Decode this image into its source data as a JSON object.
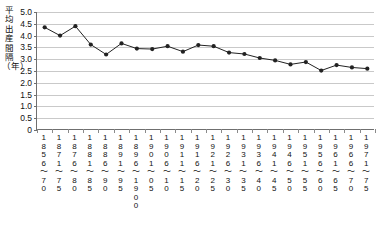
{
  "chart_data": {
    "type": "line",
    "title": "",
    "xlabel": "出生の出生年（歳）",
    "ylabel": "平均出産間隔（年）",
    "ylim": [
      0,
      5.0
    ],
    "yticks": [
      "0",
      "0.5",
      "1.0",
      "1.5",
      "2.0",
      "2.5",
      "3.0",
      "3.5",
      "4.0",
      "4.5",
      "5.0"
    ],
    "grid": true,
    "legend": "none",
    "marker": "filled-circle",
    "line_color": "#222222",
    "categories": [
      "1856～70",
      "1871～75",
      "1876～80",
      "1881～85",
      "1886～90",
      "1891～95",
      "1896～1900",
      "1901～05",
      "1906～10",
      "1911～15",
      "1916～20",
      "1921～25",
      "1926～30",
      "1931～35",
      "1936～40",
      "1941～45",
      "1946～50",
      "1951～55",
      "1956～60",
      "1961～65",
      "1966～70",
      "1971～75"
    ],
    "categories_stacked": [
      [
        "1",
        "8",
        "5",
        "6",
        "～",
        "7",
        "0"
      ],
      [
        "1",
        "8",
        "7",
        "1",
        "～",
        "7",
        "5"
      ],
      [
        "1",
        "8",
        "7",
        "6",
        "～",
        "8",
        "0"
      ],
      [
        "1",
        "8",
        "8",
        "1",
        "～",
        "8",
        "5"
      ],
      [
        "1",
        "8",
        "8",
        "6",
        "～",
        "9",
        "0"
      ],
      [
        "1",
        "8",
        "9",
        "1",
        "～",
        "9",
        "5"
      ],
      [
        "1",
        "8",
        "9",
        "6",
        "～",
        "1",
        "9",
        "0",
        "0"
      ],
      [
        "1",
        "9",
        "0",
        "1",
        "～",
        "0",
        "5"
      ],
      [
        "1",
        "9",
        "0",
        "6",
        "～",
        "1",
        "0"
      ],
      [
        "1",
        "9",
        "1",
        "1",
        "～",
        "1",
        "5"
      ],
      [
        "1",
        "9",
        "1",
        "6",
        "～",
        "2",
        "0"
      ],
      [
        "1",
        "9",
        "2",
        "1",
        "～",
        "2",
        "5"
      ],
      [
        "1",
        "9",
        "2",
        "6",
        "～",
        "3",
        "0"
      ],
      [
        "1",
        "9",
        "3",
        "1",
        "～",
        "3",
        "5"
      ],
      [
        "1",
        "9",
        "3",
        "6",
        "～",
        "4",
        "0"
      ],
      [
        "1",
        "9",
        "4",
        "1",
        "～",
        "4",
        "5"
      ],
      [
        "1",
        "9",
        "4",
        "6",
        "～",
        "5",
        "0"
      ],
      [
        "1",
        "9",
        "5",
        "1",
        "～",
        "5",
        "5"
      ],
      [
        "1",
        "9",
        "5",
        "6",
        "～",
        "6",
        "0"
      ],
      [
        "1",
        "9",
        "6",
        "1",
        "～",
        "6",
        "5"
      ],
      [
        "1",
        "9",
        "6",
        "6",
        "～",
        "7",
        "0"
      ],
      [
        "1",
        "9",
        "7",
        "1",
        "～",
        "7",
        "5"
      ]
    ],
    "values": [
      4.35,
      4.0,
      4.4,
      3.62,
      3.2,
      3.67,
      3.45,
      3.43,
      3.55,
      3.32,
      3.6,
      3.55,
      3.28,
      3.22,
      3.05,
      2.95,
      2.78,
      2.88,
      2.52,
      2.75,
      2.65,
      2.6
    ]
  },
  "axis_titles": {
    "y_chars": [
      "平",
      "均",
      "出",
      "産",
      "間",
      "隔",
      "（年）"
    ]
  }
}
